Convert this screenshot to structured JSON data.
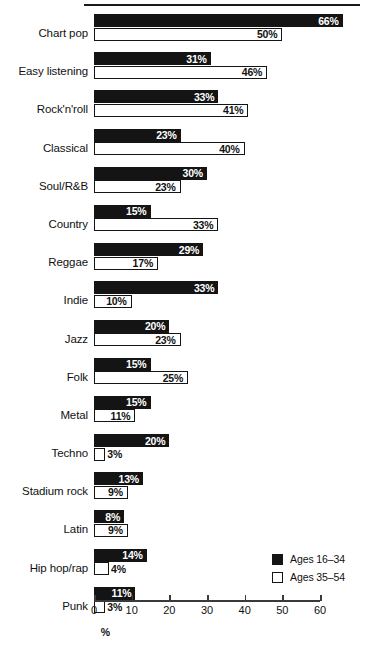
{
  "chart_data": {
    "type": "bar",
    "orientation": "horizontal",
    "title": "",
    "xlabel": "%",
    "ylabel": "",
    "xlim": [
      0,
      60
    ],
    "xticks": [
      0,
      10,
      20,
      30,
      40,
      50,
      60
    ],
    "grid": false,
    "legend_position": "bottom-right",
    "categories": [
      "Chart pop",
      "Easy listening",
      "Rock'n'roll",
      "Classical",
      "Soul/R&B",
      "Country",
      "Reggae",
      "Indie",
      "Jazz",
      "Folk",
      "Metal",
      "Techno",
      "Stadium rock",
      "Latin",
      "Hip hop/rap",
      "Punk"
    ],
    "series": [
      {
        "name": "Ages 16–34",
        "color": "#141414",
        "values": [
          66,
          31,
          33,
          23,
          30,
          15,
          29,
          33,
          20,
          15,
          15,
          20,
          13,
          8,
          14,
          11
        ],
        "labels": [
          "66%",
          "31%",
          "33%",
          "23%",
          "30%",
          "15%",
          "29%",
          "33%",
          "20%",
          "15%",
          "15%",
          "20%",
          "13%",
          "8%",
          "14%",
          "11%"
        ]
      },
      {
        "name": "Ages 35–54",
        "color": "#ffffff",
        "values": [
          50,
          46,
          41,
          40,
          23,
          33,
          17,
          10,
          23,
          25,
          11,
          3,
          9,
          9,
          4,
          3
        ],
        "labels": [
          "50%",
          "46%",
          "41%",
          "40%",
          "23%",
          "33%",
          "17%",
          "10%",
          "23%",
          "25%",
          "11%",
          "3%",
          "9%",
          "9%",
          "4%",
          "3%"
        ]
      }
    ]
  },
  "legend": {
    "items": [
      {
        "label": "Ages 16–34",
        "swatch": "dark"
      },
      {
        "label": "Ages 35–54",
        "swatch": "light"
      }
    ]
  },
  "axis": {
    "title": "%",
    "tick_labels": [
      "0",
      "10",
      "20",
      "30",
      "40",
      "50",
      "60"
    ]
  }
}
